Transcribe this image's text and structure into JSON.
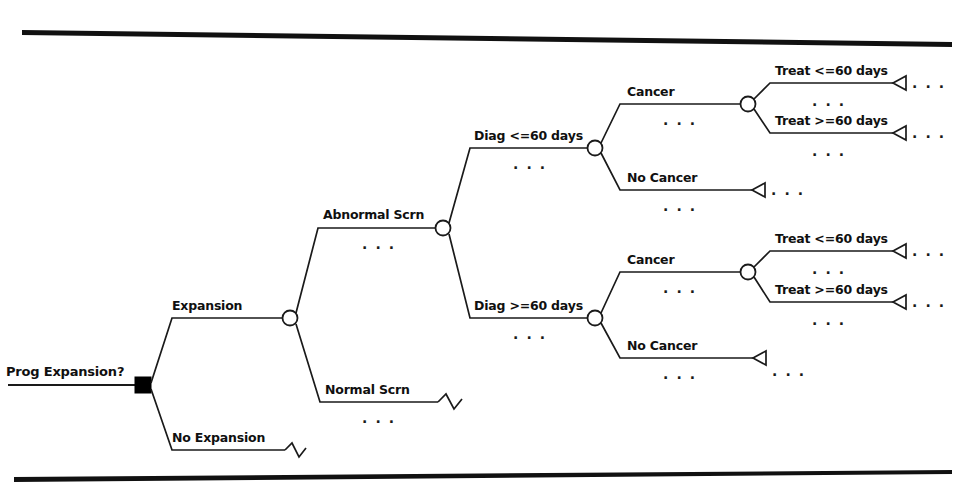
{
  "diagram": {
    "type": "decision-tree",
    "root": {
      "label": "Prog Expansion?",
      "node_type": "decision-square"
    },
    "branches": {
      "expansion": "Expansion",
      "no_expansion": "No Expansion",
      "abnormal_scrn": "Abnormal Scrn",
      "normal_scrn": "Normal Scrn",
      "diag_le_60": "Diag <=60 days",
      "diag_ge_60": "Diag >=60 days",
      "cancer_upper": "Cancer",
      "no_cancer_upper": "No Cancer",
      "cancer_lower": "Cancer",
      "no_cancer_lower": "No Cancer",
      "treat_le_60_upper": "Treat <=60 days",
      "treat_ge_60_upper": "Treat >=60 days",
      "treat_le_60_lower": "Treat <=60 days",
      "treat_ge_60_lower": "Treat >=60 days"
    },
    "ellipsis": {
      "e1": ". . .",
      "e2": ". . .",
      "e3": ". . .",
      "e4": ". . .",
      "e5": ". . .",
      "e6": ". . .",
      "e7": ". . .",
      "e8": ". . .",
      "e9": ". . .",
      "e10": ". . .",
      "e11": ". . .",
      "e12": ". . .",
      "e13": ". . .",
      "e14": ". . .",
      "e15": ". . .",
      "e16": ". . .",
      "e17": ". . .",
      "e18": ". . ."
    },
    "colors": {
      "ink": "#1a1a1a",
      "background": "#ffffff",
      "node_fill": "#ffffff",
      "decision_fill": "#000000"
    }
  }
}
